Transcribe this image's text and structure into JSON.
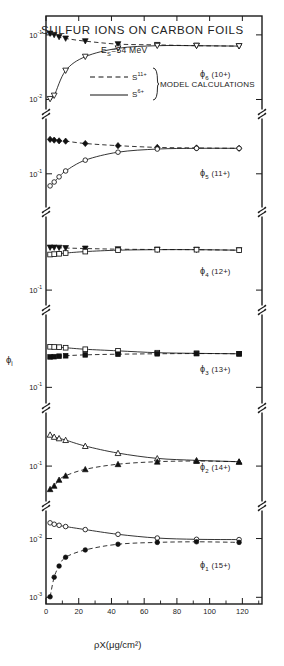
{
  "figure": {
    "title": "SULFUR IONS ON CARBON FOILS",
    "subtitle_pre": "E",
    "subtitle_sub": "S",
    "subtitle_post": "=54 MeV",
    "legend": {
      "dashed_label_base": "S",
      "dashed_label_sup": "11+",
      "solid_label_base": "S",
      "solid_label_sup": "6+",
      "brace_text": "MODEL CALCULATIONS"
    },
    "ylabel_base": "ϕ",
    "ylabel_sub": "i",
    "xlabel": "ρX(μg/cm²)",
    "frame_color": "#1a1a1a",
    "data_color": "#111111"
  },
  "chart_data": {
    "type": "scatter",
    "title": "SULFUR IONS ON CARBON FOILS",
    "subtitle": "E_S=54 MeV",
    "xlabel": "ρX(μg/cm²)",
    "ylabel": "ϕ_i",
    "xlim": [
      0,
      132
    ],
    "xticks": [
      0,
      20,
      40,
      60,
      80,
      100,
      120
    ],
    "xticklabels": [
      "0",
      "20",
      "40",
      "60",
      "80",
      "100",
      "120"
    ],
    "yscale": "log",
    "grid": false,
    "legend_position": "top-center",
    "legend_entries": [
      {
        "name": "S(11+) incident",
        "style": "dashed",
        "marker": "filled"
      },
      {
        "name": "S(6+) incident",
        "style": "solid",
        "marker": "open"
      }
    ],
    "panels": [
      {
        "id": "phi6",
        "label_base": "ϕ",
        "label_sub": "6",
        "label_charge": "(10+)",
        "ylim": [
          0.007,
          0.17
        ],
        "yticks": [
          0.1,
          0.01
        ],
        "yticklabels": [
          "10⁻¹",
          "10⁻²"
        ],
        "series": [
          {
            "name": "S11+ incident",
            "marker": "filled-triangle-down",
            "line": "dashed",
            "x": [
              2.5,
              5,
              8,
              12,
              24,
              44,
              68,
              92,
              118
            ],
            "y": [
              0.105,
              0.1,
              0.093,
              0.088,
              0.08,
              0.072,
              0.07,
              0.068,
              0.067
            ]
          },
          {
            "name": "S6+ incident",
            "marker": "open-triangle-down",
            "line": "solid",
            "x": [
              2.5,
              5,
              12,
              24,
              44,
              68,
              92,
              118
            ],
            "y": [
              0.0102,
              0.0115,
              0.028,
              0.046,
              0.062,
              0.068,
              0.068,
              0.067
            ]
          }
        ]
      },
      {
        "id": "phi5",
        "label_base": "ϕ",
        "label_sub": "5",
        "label_charge": "(11+)",
        "ylim": [
          0.04,
          0.45
        ],
        "yticks": [
          0.1,
          0.01
        ],
        "yticklabels": [
          "10⁻¹",
          "10⁻²"
        ],
        "series": [
          {
            "name": "S11+ incident",
            "marker": "filled-diamond",
            "line": "dashed",
            "x": [
              2.5,
              5,
              8,
              12,
              24,
              44,
              68,
              92,
              118
            ],
            "y": [
              0.255,
              0.25,
              0.245,
              0.243,
              0.228,
              0.215,
              0.205,
              0.202,
              0.2
            ]
          },
          {
            "name": "S6+ incident",
            "marker": "open-circle",
            "line": "solid",
            "x": [
              2.5,
              5,
              8,
              12,
              24,
              44,
              68,
              92,
              118
            ],
            "y": [
              0.072,
              0.08,
              0.092,
              0.108,
              0.145,
              0.18,
              0.196,
              0.2,
              0.2
            ]
          }
        ]
      },
      {
        "id": "phi4",
        "label_base": "ϕ",
        "label_sub": "4",
        "label_charge": "(12+)",
        "ylim": [
          0.07,
          0.55
        ],
        "yticks": [
          0.01,
          0.1
        ],
        "yticklabels": [
          "10⁻²",
          "10⁻¹"
        ],
        "series": [
          {
            "name": "S11+ incident",
            "marker": "filled-triangle-down",
            "line": "dashed",
            "x": [
              2.5,
              5,
              8,
              12,
              24,
              44,
              68,
              92,
              118
            ],
            "y": [
              0.268,
              0.268,
              0.267,
              0.265,
              0.262,
              0.258,
              0.256,
              0.255,
              0.252
            ]
          },
          {
            "name": "S6+ incident",
            "marker": "open-square",
            "line": "solid",
            "x": [
              2.5,
              5,
              8,
              12,
              24,
              44,
              68,
              92,
              118
            ],
            "y": [
              0.228,
              0.23,
              0.232,
              0.236,
              0.244,
              0.252,
              0.255,
              0.255,
              0.252
            ]
          }
        ]
      },
      {
        "id": "phi3",
        "label_base": "ϕ",
        "label_sub": "3",
        "label_charge": "(13+)",
        "ylim": [
          0.07,
          0.5
        ],
        "yticks": [
          0.1
        ],
        "yticklabels": [
          "10⁻¹"
        ],
        "series": [
          {
            "name": "S6+ incident",
            "marker": "open-square",
            "line": "solid",
            "x": [
              2.5,
              5,
              8,
              12,
              24,
              44,
              68,
              92,
              118
            ],
            "y": [
              0.245,
              0.244,
              0.243,
              0.24,
              0.232,
              0.224,
              0.215,
              0.212,
              0.21
            ]
          },
          {
            "name": "S11+ incident",
            "marker": "filled-square",
            "line": "dashed",
            "x": [
              2.5,
              5,
              8,
              12,
              24,
              44,
              68,
              92,
              118
            ],
            "y": [
              0.196,
              0.197,
              0.199,
              0.201,
              0.205,
              0.208,
              0.21,
              0.211,
              0.21
            ]
          }
        ]
      },
      {
        "id": "phi2",
        "label_base": "ϕ",
        "label_sub": "2",
        "label_charge": "(14+)",
        "ylim": [
          0.04,
          0.4
        ],
        "yticks": [
          0.1
        ],
        "yticklabels": [
          "10⁻¹"
        ],
        "series": [
          {
            "name": "S6+ incident",
            "marker": "open-triangle-up",
            "line": "solid",
            "x": [
              2.5,
              5,
              8,
              12,
              24,
              44,
              68,
              92,
              118
            ],
            "y": [
              0.225,
              0.213,
              0.205,
              0.196,
              0.168,
              0.14,
              0.122,
              0.116,
              0.112
            ]
          },
          {
            "name": "S11+ incident",
            "marker": "filled-triangle-up",
            "line": "dashed",
            "x": [
              2.5,
              5,
              8,
              12,
              24,
              44,
              68,
              92,
              118
            ],
            "y": [
              0.055,
              0.06,
              0.07,
              0.078,
              0.092,
              0.105,
              0.112,
              0.114,
              0.112
            ]
          }
        ]
      },
      {
        "id": "phi1",
        "label_base": "ϕ",
        "label_sub": "1",
        "label_charge": "(15+)",
        "ylim": [
          0.0009,
          0.03
        ],
        "yticks": [
          0.01,
          0.001
        ],
        "yticklabels": [
          "10⁻²",
          "10⁻³"
        ],
        "series": [
          {
            "name": "S6+ incident",
            "marker": "open-circle",
            "line": "solid",
            "x": [
              2.5,
              5,
              8,
              12,
              24,
              44,
              68,
              92,
              118
            ],
            "y": [
              0.0185,
              0.0175,
              0.0168,
              0.016,
              0.0142,
              0.0118,
              0.0102,
              0.0097,
              0.0096
            ]
          },
          {
            "name": "S11+ incident",
            "marker": "filled-circle",
            "line": "dashed",
            "x": [
              2.5,
              5,
              8,
              12,
              24,
              44,
              68,
              92,
              118
            ],
            "y": [
              0.00102,
              0.0022,
              0.0034,
              0.0048,
              0.0064,
              0.008,
              0.0086,
              0.0088,
              0.0086
            ]
          }
        ]
      }
    ]
  }
}
